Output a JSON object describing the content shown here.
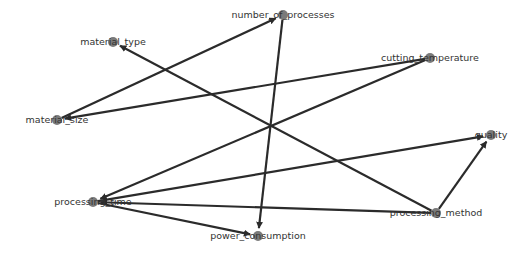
{
  "diagram": {
    "type": "directed-graph",
    "colors": {
      "node": "#7a7a7a",
      "edge": "#2b2b2b",
      "label": "#333333",
      "background": "#ffffff"
    },
    "nodes": [
      {
        "id": "number_of_processes",
        "label": "number_of_processes",
        "x": 283,
        "y": 15
      },
      {
        "id": "material_type",
        "label": "material_type",
        "x": 113,
        "y": 42
      },
      {
        "id": "cutting_temperature",
        "label": "cutting_temperature",
        "x": 430,
        "y": 58
      },
      {
        "id": "material_size",
        "label": "material_size",
        "x": 57,
        "y": 120
      },
      {
        "id": "quality",
        "label": "quality",
        "x": 491,
        "y": 135
      },
      {
        "id": "processing_time",
        "label": "processing_time",
        "x": 93,
        "y": 202
      },
      {
        "id": "processing_method",
        "label": "processing_method",
        "x": 436,
        "y": 213
      },
      {
        "id": "power_consumption",
        "label": "power_consumption",
        "x": 258,
        "y": 236
      }
    ],
    "edges": [
      {
        "from": "material_size",
        "to": "number_of_processes"
      },
      {
        "from": "cutting_temperature",
        "to": "material_size"
      },
      {
        "from": "cutting_temperature",
        "to": "processing_time"
      },
      {
        "from": "processing_method",
        "to": "material_type"
      },
      {
        "from": "processing_method",
        "to": "quality"
      },
      {
        "from": "processing_method",
        "to": "processing_time"
      },
      {
        "from": "processing_time",
        "to": "quality"
      },
      {
        "from": "processing_time",
        "to": "power_consumption"
      },
      {
        "from": "number_of_processes",
        "to": "power_consumption"
      }
    ]
  }
}
